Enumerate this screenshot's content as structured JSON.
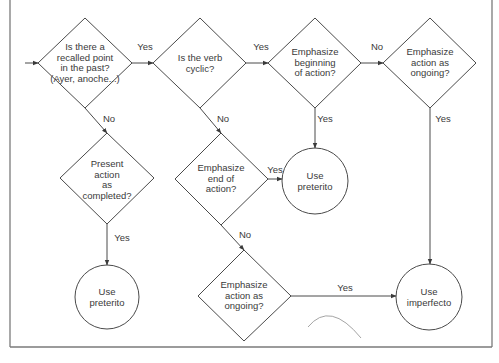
{
  "diagram": {
    "colors": {
      "stroke": "#4a4a4a",
      "frame": "#7a7a7a",
      "text": "#3a3a3a",
      "arc": "#9a9a9a"
    },
    "nodes": {
      "q_recalled": {
        "text": "Is there a\nrecalled point\nin the past?\n(Ayer, anoche...)"
      },
      "q_cyclic": {
        "text": "Is the verb\ncyclic?"
      },
      "q_beginning": {
        "text": "Emphasize\nbeginning\nof action?"
      },
      "q_ongoing_top": {
        "text": "Emphasize\naction as\nongoing?"
      },
      "q_completed": {
        "text": "Present\naction\nas\ncompleted?"
      },
      "q_end": {
        "text": "Emphasize\nend of\naction?"
      },
      "q_ongoing_bottom": {
        "text": "Emphasize\naction as\nongoing?"
      },
      "r_preterito_left": {
        "text": "Use\npreterito"
      },
      "r_preterito_mid": {
        "text": "Use\npreterito"
      },
      "r_imperfecto": {
        "text": "Use\nimperfecto"
      }
    },
    "edges": {
      "recalled_yes": "Yes",
      "recalled_no": "No",
      "cyclic_yes": "Yes",
      "cyclic_no": "No",
      "beginning_no": "No",
      "beginning_yes": "Yes",
      "ongoing_top_yes": "Yes",
      "completed_yes": "Yes",
      "end_yes": "Yes",
      "end_no": "No",
      "ongoing_bottom_yes": "Yes"
    }
  }
}
